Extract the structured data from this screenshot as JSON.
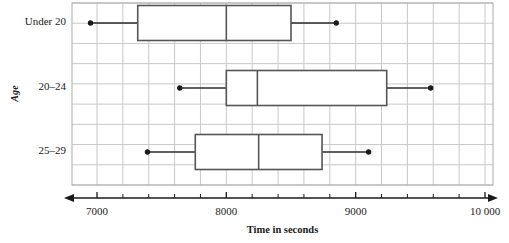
{
  "chart_data": {
    "type": "box",
    "title": "",
    "xlabel": "Time in seconds",
    "ylabel": "Age",
    "categories": [
      "Under 20",
      "20–24",
      "25–29"
    ],
    "xlim": [
      6800,
      10100
    ],
    "xticks": [
      7000,
      8000,
      9000,
      10000
    ],
    "xtick_labels": [
      "7000",
      "8000",
      "9000",
      "10 000"
    ],
    "grid": true,
    "grid_step": 200,
    "legend": "none",
    "orientation": "horizontal",
    "boxes": [
      {
        "category": "Under 20",
        "min": 6950,
        "q1": 7315,
        "median": 8000,
        "q3": 8500,
        "max": 8850
      },
      {
        "category": "20–24",
        "min": 7640,
        "q1": 8000,
        "median": 8240,
        "q3": 9240,
        "max": 9580
      },
      {
        "category": "25–29",
        "min": 7390,
        "q1": 7760,
        "median": 8250,
        "q3": 8740,
        "max": 9100
      }
    ],
    "colors": {
      "box_stroke": "#565656",
      "whisker": "#2b2b2b",
      "point": "#1a1a1a",
      "grid": "#c8c8c8",
      "frame": "#aaaaaa",
      "axis": "#1a1a1a",
      "box_fill": "#ffffff"
    }
  }
}
